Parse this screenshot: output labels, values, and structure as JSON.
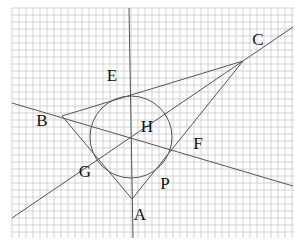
{
  "diagram": {
    "type": "geometry-construction-on-grid-paper",
    "grid": {
      "x0": 12,
      "y0": 8,
      "x1": 294,
      "y1": 238,
      "spacing": 7,
      "color": "#c8c8c8"
    },
    "colors": {
      "line": "#555555",
      "label": "#111111",
      "background": "#ffffff"
    },
    "points": {
      "A": {
        "x": 132,
        "y": 199
      },
      "B": {
        "x": 62,
        "y": 116
      },
      "C": {
        "x": 243,
        "y": 61
      },
      "H": {
        "x": 132,
        "y": 139
      },
      "E": {
        "x": 131,
        "y": 96
      },
      "F": {
        "x": 172,
        "y": 150
      },
      "G": {
        "x": 97,
        "y": 160
      },
      "P": {
        "x": 162,
        "y": 172
      }
    },
    "circle": {
      "cx": 131,
      "cy": 137,
      "r": 41
    },
    "labels": [
      {
        "text": "A",
        "x": 140,
        "y": 214
      },
      {
        "text": "B",
        "x": 42,
        "y": 120
      },
      {
        "text": "C",
        "x": 258,
        "y": 39
      },
      {
        "text": "E",
        "x": 112,
        "y": 75
      },
      {
        "text": "F",
        "x": 198,
        "y": 143
      },
      {
        "text": "G",
        "x": 85,
        "y": 171
      },
      {
        "text": "H",
        "x": 147,
        "y": 126
      },
      {
        "text": "P",
        "x": 165,
        "y": 183
      }
    ]
  }
}
